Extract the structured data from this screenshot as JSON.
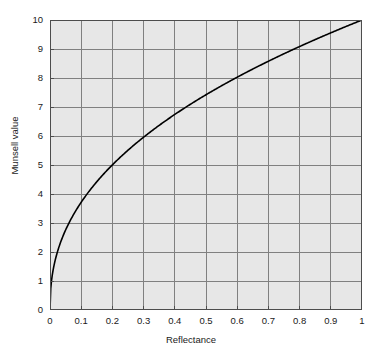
{
  "chart_data": {
    "type": "line",
    "title": "",
    "xlabel": "Reflectance",
    "ylabel": "Munsell value",
    "xlim": [
      0,
      1
    ],
    "ylim": [
      0,
      10
    ],
    "grid": true,
    "legend": "none",
    "series": [
      {
        "name": "Munsell value function",
        "formula_note": "V = 10 * R^0.43",
        "x": [
          0,
          0.005,
          0.01,
          0.02,
          0.03,
          0.04,
          0.05,
          0.06,
          0.07,
          0.08,
          0.09,
          0.1,
          0.12,
          0.14,
          0.16,
          0.18,
          0.2,
          0.25,
          0.3,
          0.35,
          0.4,
          0.45,
          0.5,
          0.55,
          0.6,
          0.65,
          0.7,
          0.75,
          0.8,
          0.85,
          0.9,
          0.95,
          1
        ],
        "values": [
          0,
          1.01,
          1.36,
          1.83,
          2.18,
          2.46,
          2.71,
          2.93,
          3.12,
          3.31,
          3.48,
          3.64,
          3.93,
          4.18,
          4.41,
          4.62,
          4.82,
          5.26,
          5.64,
          5.98,
          6.28,
          6.56,
          6.81,
          7.05,
          7.28,
          7.49,
          7.69,
          7.88,
          8.06,
          8.24,
          8.41,
          8.57,
          10
        ]
      }
    ],
    "x_ticks": [
      "0",
      "0.1",
      "0.2",
      "0.3",
      "0.4",
      "0.5",
      "0.6",
      "0.7",
      "0.8",
      "0.9",
      "1"
    ],
    "x_tick_values": [
      0,
      0.1,
      0.2,
      0.3,
      0.4,
      0.5,
      0.6,
      0.7,
      0.8,
      0.9,
      1
    ],
    "y_ticks": [
      "0",
      "1",
      "2",
      "3",
      "4",
      "5",
      "6",
      "7",
      "8",
      "9",
      "10"
    ],
    "y_tick_values": [
      0,
      1,
      2,
      3,
      4,
      5,
      6,
      7,
      8,
      9,
      10
    ],
    "colors": {
      "plot_background": "#e7e7e7",
      "gridline": "#808080",
      "curve": "#000000",
      "axis": "#4d4d4d",
      "text": "#1a1a1a",
      "page_background": "#ffffff"
    }
  }
}
